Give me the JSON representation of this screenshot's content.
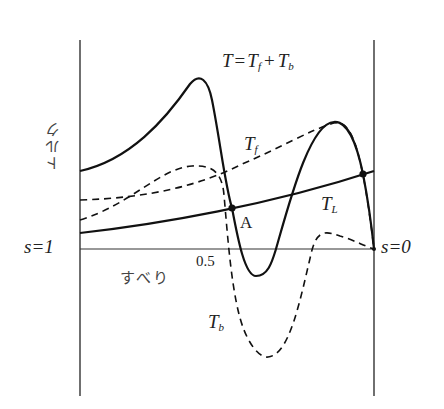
{
  "diagram": {
    "type": "torque-slip characteristic",
    "y_axis_label": "トルク",
    "x_axis_label": "すべり",
    "x_left_label": "s=1",
    "x_right_label": "s=0",
    "x_mid_tick": "0.5",
    "curves": {
      "total": {
        "label_T": "T",
        "label_eq": "=",
        "label_Tf": "T",
        "sub_f": "f",
        "label_plus": "+",
        "label_Tb": "T",
        "sub_b": "b",
        "style": "solid"
      },
      "forward": {
        "label": "T",
        "sub": "f",
        "style": "dashed"
      },
      "backward": {
        "label": "T",
        "sub": "b",
        "style": "dashed"
      },
      "load": {
        "label": "T",
        "sub": "L",
        "style": "solid"
      }
    },
    "points": [
      {
        "name": "A",
        "label": "A"
      },
      {
        "name": "stable-point",
        "label": ""
      }
    ],
    "colors": {
      "line": "#111111",
      "axis": "#333333",
      "background": "#ffffff"
    }
  }
}
